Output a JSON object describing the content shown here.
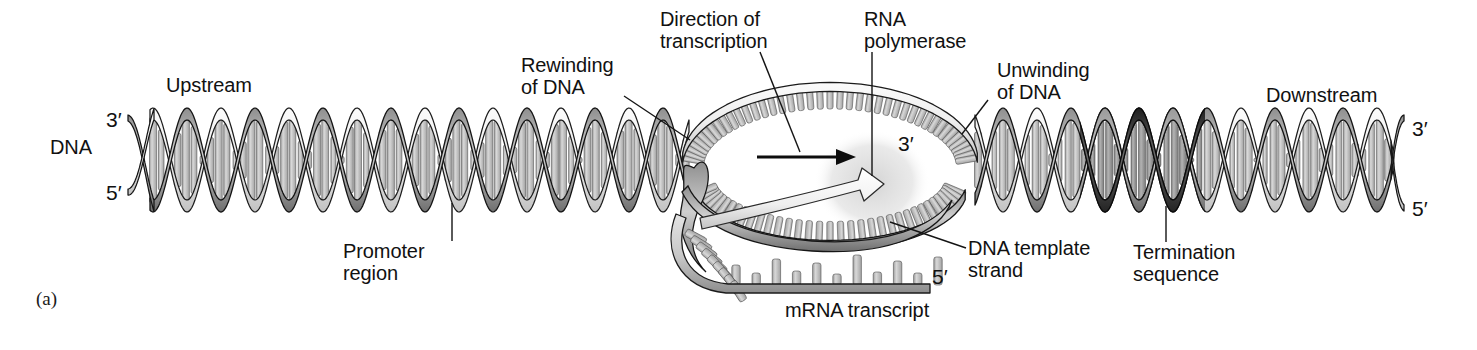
{
  "figure": {
    "panel_label": "(a)",
    "background_color": "#ffffff",
    "ink_color": "#111111"
  },
  "labels": {
    "dna": "DNA",
    "upstream": "Upstream",
    "promoter_region": "Promoter\nregion",
    "rewinding_of_dna": "Rewinding\nof DNA",
    "direction_of_transcription": "Direction of\ntranscription",
    "rna_polymerase": "RNA\npolymerase",
    "unwinding_of_dna": "Unwinding\nof DNA",
    "downstream": "Downstream",
    "dna_template_strand": "DNA template\nstrand",
    "termination_sequence": "Termination\nsequence",
    "mrna_transcript": "mRNA transcript"
  },
  "end_labels": {
    "left_top": "3′",
    "left_bottom": "5′",
    "right_top": "3′",
    "right_bottom": "5′",
    "bubble_template_3prime": "3′",
    "mrna_5prime": "5′"
  },
  "colors": {
    "ribbon_light": "#e8e8e8",
    "ribbon_mid": "#9a9a9a",
    "ribbon_dark": "#5a5a5a",
    "ribbon_termination": "#3a3a3a",
    "base_pair_fill": "#b9b9b9",
    "base_pair_light": "#d6d6d6",
    "polymerase_blob": "#d9d9d9",
    "outline": "#1a1a1a",
    "mrna_backbone": "#c9c9c9"
  },
  "geometry": {
    "helix_period_px": 68,
    "helix_top_y": 114,
    "helix_bottom_y": 206,
    "helix_axis_y": 160,
    "left_helix_x_start": 150,
    "left_helix_x_end": 690,
    "right_helix_x_start": 975,
    "right_helix_x_end": 1395,
    "bubble_center_x": 830,
    "bubble_center_y": 165,
    "bubble_rx": 148,
    "bubble_ry": 78
  },
  "arrow": {
    "name": "direction-of-transcription-arrow",
    "x1": 757,
    "x2": 852,
    "y": 157
  }
}
